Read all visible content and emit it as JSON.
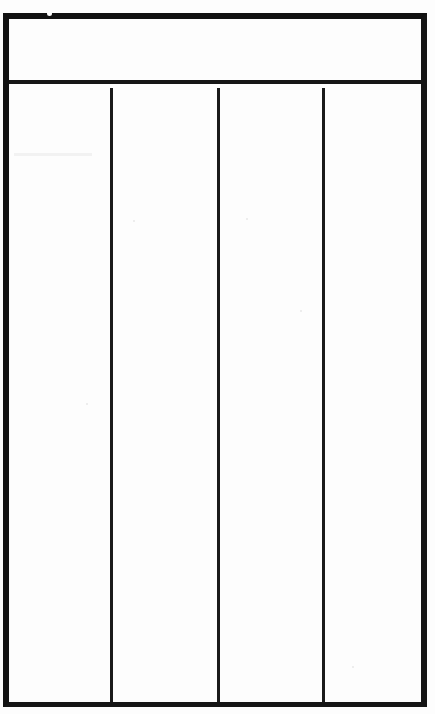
{
  "document": {
    "kind": "blank-table-form",
    "title": "",
    "caption": "",
    "background_color": "#fdfdfd",
    "ink_color": "#111111",
    "page_width": 435,
    "page_height": 714
  },
  "table": {
    "frame": {
      "left": 3,
      "top": 13,
      "width": 424,
      "height": 694,
      "border_color": "#111111",
      "outer_border_width": 6,
      "rule_color": "#1a1a1a",
      "inner_rule_width": 3
    },
    "header": {
      "height": 65,
      "separator_width": 4,
      "cells": [
        {
          "label": ""
        },
        {
          "label": ""
        },
        {
          "label": ""
        },
        {
          "label": ""
        }
      ]
    },
    "columns": [
      {
        "name": "column-1",
        "label": "",
        "left_pct": 0,
        "width_pct": 24.5
      },
      {
        "name": "column-2",
        "label": "",
        "left_pct": 24.5,
        "width_pct": 26.0
      },
      {
        "name": "column-3",
        "label": "",
        "left_pct": 50.5,
        "width_pct": 25.5
      },
      {
        "name": "column-4",
        "label": "",
        "left_pct": 76.0,
        "width_pct": 24.0
      }
    ],
    "rows": [],
    "row_count": 0,
    "body_text": ""
  },
  "artifacts": {
    "top_rule_speck": {
      "x": 47,
      "y": 11,
      "size": 5
    },
    "column_one_smudge": {
      "x": 14,
      "y": 153,
      "width": 78,
      "height": 3
    },
    "flecks": [
      {
        "x": 246,
        "y": 218,
        "size": 2
      },
      {
        "x": 133,
        "y": 220,
        "size": 2
      },
      {
        "x": 352,
        "y": 666,
        "size": 2
      },
      {
        "x": 86,
        "y": 403,
        "size": 2
      },
      {
        "x": 300,
        "y": 310,
        "size": 2
      }
    ]
  }
}
